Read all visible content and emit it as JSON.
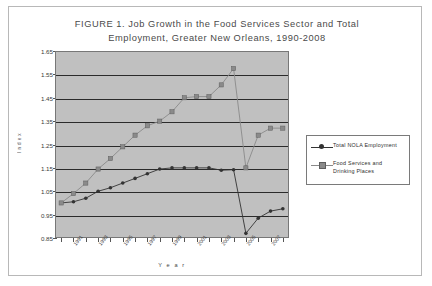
{
  "figure": {
    "title_line1": "FIGURE 1.   Job Growth in the Food Services Sector and Total",
    "title_line2": "Employment, Greater New Orleans, 1990-2008"
  },
  "legend": {
    "items": [
      {
        "label": "Total NOLA  Employment",
        "marker": "black-diamond-marker",
        "color": "#333333"
      },
      {
        "label": "Food Services and\nDrinking Places",
        "marker": "gray-square-marker",
        "color": "#8a8a8a"
      }
    ]
  },
  "chart_data": {
    "type": "line",
    "title": "FIGURE 1.   Job Growth in the Food Services Sector and Total Employment, Greater New Orleans, 1990-2008",
    "xlabel": "Year",
    "ylabel": "Index",
    "ylim": [
      0.85,
      1.65
    ],
    "ytick_step": 0.1,
    "yticks": [
      "0.85",
      "0.95",
      "1.05",
      "1.15",
      "1.25",
      "1.35",
      "1.45",
      "1.55",
      "1.65"
    ],
    "grid": true,
    "legend_position": "right",
    "plot_background": "#c0c0c0",
    "x": [
      1990,
      1991,
      1992,
      1993,
      1994,
      1995,
      1996,
      1997,
      1998,
      1999,
      2000,
      2001,
      2002,
      2003,
      2004,
      2005,
      2006,
      2007,
      2008
    ],
    "xtick_labels": [
      "1990",
      "1991",
      "1992",
      "1993",
      "1994",
      "1995",
      "1996",
      "1997",
      "1998",
      "1999",
      "2000",
      "2001",
      "2002",
      "2003",
      "2004",
      "2005",
      "2006",
      "2007",
      "2008"
    ],
    "xtick_labels_shown": [
      "1991",
      "1993",
      "1995",
      "1997",
      "1999",
      "2001",
      "2003",
      "2005",
      "2007"
    ],
    "series": [
      {
        "name": "Total NOLA  Employment",
        "color": "#333333",
        "marker": "diamond",
        "values": [
          1.0,
          1.005,
          1.02,
          1.05,
          1.065,
          1.085,
          1.105,
          1.125,
          1.145,
          1.15,
          1.15,
          1.15,
          1.15,
          1.14,
          1.142,
          0.87,
          0.935,
          0.965,
          0.975
        ]
      },
      {
        "name": "Food Services and Drinking Places",
        "color": "#8a8a8a",
        "marker": "square",
        "values": [
          1.0,
          1.04,
          1.085,
          1.145,
          1.19,
          1.24,
          1.29,
          1.33,
          1.35,
          1.39,
          1.45,
          1.455,
          1.455,
          1.505,
          1.575,
          1.15,
          1.29,
          1.32,
          1.32
        ]
      }
    ]
  },
  "axes": {
    "x_title": "Y e a r",
    "y_title": "I n d e x"
  }
}
